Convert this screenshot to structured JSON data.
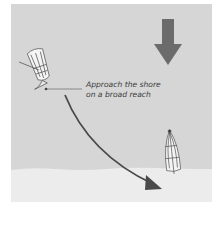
{
  "diagram": {
    "annotation": {
      "line1": "Approach the shore",
      "line2": "on a broad reach"
    },
    "elements": {
      "wind_arrow": {
        "direction": "down",
        "icon": "wind-arrow-icon"
      },
      "boat_start": {
        "icon": "dinghy-icon",
        "position": "upper-left"
      },
      "boat_end": {
        "icon": "dinghy-icon",
        "position": "lower-right, on shore"
      },
      "course_arrow": {
        "icon": "curved-arrow-icon"
      }
    },
    "colors": {
      "water": "#d6d6d6",
      "shore": "#ececec",
      "wind_arrow": "#6b6b6b",
      "course_arrow": "#4a4a4a",
      "text": "#3a3a3a"
    }
  }
}
